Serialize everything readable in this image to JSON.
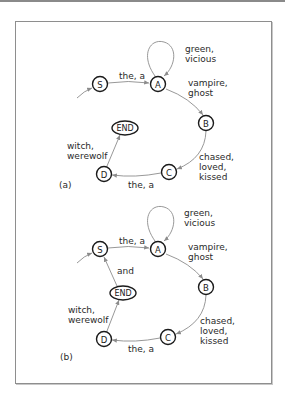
{
  "figure": {
    "panels": [
      {
        "id": "a",
        "label": "(a)",
        "nodes": {
          "S": "S",
          "A": "A",
          "B": "B",
          "C": "C",
          "D": "D",
          "END": "END"
        },
        "edges": {
          "start_to_S": "",
          "S_to_A": "the, a",
          "A_loop_line1": "green,",
          "A_loop_line2": "vicious",
          "A_to_B_line1": "vampire,",
          "A_to_B_line2": "ghost",
          "B_to_C_line1": "chased,",
          "B_to_C_line2": "loved,",
          "B_to_C_line3": "kissed",
          "C_to_D": "the, a",
          "D_to_END_line1": "witch,",
          "D_to_END_line2": "werewolf"
        }
      },
      {
        "id": "b",
        "label": "(b)",
        "nodes": {
          "S": "S",
          "A": "A",
          "B": "B",
          "C": "C",
          "D": "D",
          "END": "END"
        },
        "edges": {
          "start_to_S": "",
          "S_to_A": "the, a",
          "A_loop_line1": "green,",
          "A_loop_line2": "vicious",
          "A_to_B_line1": "vampire,",
          "A_to_B_line2": "ghost",
          "B_to_C_line1": "chased,",
          "B_to_C_line2": "loved,",
          "B_to_C_line3": "kissed",
          "C_to_D": "the, a",
          "D_to_END_line1": "witch,",
          "D_to_END_line2": "werewolf",
          "END_to_S": "and"
        }
      }
    ]
  },
  "colors": {
    "edge": "#8c8c8c",
    "node_stroke": "#1a1a1a",
    "text": "#2a2a2a",
    "frame": "#8e8e8e"
  }
}
